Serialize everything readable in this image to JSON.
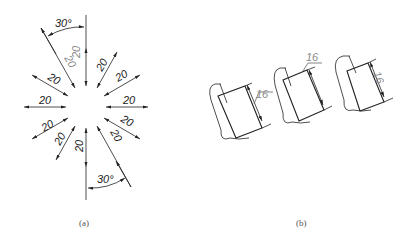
{
  "figure_a": {
    "caption": "(a)",
    "angle_label_top": "30°",
    "angle_label_bottom": "30°",
    "dimension_labels": [
      "20",
      "20",
      "20",
      "20",
      "20",
      "20",
      "20",
      "20",
      "20",
      "20",
      "20",
      "20"
    ],
    "grey_labels": [
      "20",
      "20"
    ]
  },
  "figure_b": {
    "caption": "(b)",
    "views": [
      {
        "label": "16",
        "placement": "leader-right"
      },
      {
        "label": "16",
        "placement": "leader-top"
      },
      {
        "label": "16",
        "placement": "inline-rotated"
      }
    ]
  },
  "colors": {
    "line": "#222222",
    "grey_text": "#888888",
    "caption": "#555555"
  }
}
